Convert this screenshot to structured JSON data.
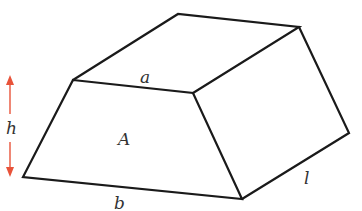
{
  "diagram": {
    "type": "prismoid-trapezoidal-prism",
    "labels": {
      "top_edge": "a",
      "bottom_edge": "b",
      "front_face_area": "A",
      "height": "h",
      "length": "l"
    },
    "colors": {
      "edges": "#1a1a1a",
      "height_arrow": "#e8533a",
      "labels": "#333333"
    }
  }
}
